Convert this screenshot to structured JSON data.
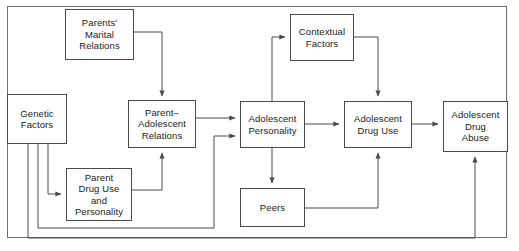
{
  "diagram": {
    "type": "flowchart",
    "stroke_color": "#4a4a4a",
    "text_color": "#1a1a1a",
    "background_color": "#ffffff",
    "frame": {
      "present": true,
      "x": 7,
      "y": 6,
      "width": 500,
      "height": 232
    },
    "nodes": [
      {
        "id": "parents-marital-relations",
        "label": "Parents'\nMarital\nRelations",
        "x": 65,
        "y": 9,
        "width": 69,
        "height": 51
      },
      {
        "id": "contextual-factors",
        "label": "Contextual\nFactors",
        "x": 290,
        "y": 14,
        "width": 64,
        "height": 47
      },
      {
        "id": "genetic-factors",
        "label": "Genetic\nFactors",
        "x": 7,
        "y": 94,
        "width": 60,
        "height": 50
      },
      {
        "id": "parent-adolescent-relations",
        "label": "Parent–\nAdolescent\nRelations",
        "x": 128,
        "y": 100,
        "width": 68,
        "height": 48
      },
      {
        "id": "adolescent-personality",
        "label": "Adolescent\nPersonality",
        "x": 240,
        "y": 101,
        "width": 65,
        "height": 47
      },
      {
        "id": "adolescent-drug-use",
        "label": "Adolescent\nDrug Use",
        "x": 344,
        "y": 101,
        "width": 68,
        "height": 47
      },
      {
        "id": "adolescent-drug-abuse",
        "label": "Adolescent\nDrug\nAbuse",
        "x": 443,
        "y": 101,
        "width": 65,
        "height": 51
      },
      {
        "id": "parent-drug-use-and-personality",
        "label": "Parent\nDrug Use\nand\nPersonality",
        "x": 66,
        "y": 168,
        "width": 66,
        "height": 53
      },
      {
        "id": "peers",
        "label": "Peers",
        "x": 240,
        "y": 188,
        "width": 65,
        "height": 39
      }
    ],
    "edges": [
      {
        "id": "marital-to-parent-adolescent",
        "from": "parents-marital-relations",
        "to": "parent-adolescent-relations",
        "arrow": true
      },
      {
        "id": "genetic-to-parent-drug-use",
        "from": "genetic-factors",
        "to": "parent-drug-use-and-personality",
        "arrow": true
      },
      {
        "id": "genetic-to-adolescent-personality",
        "from": "genetic-factors",
        "to": "adolescent-personality",
        "arrow": true
      },
      {
        "id": "genetic-to-adolescent-drug-abuse",
        "from": "genetic-factors",
        "to": "adolescent-drug-abuse",
        "arrow": true
      },
      {
        "id": "parent-drug-use-to-parent-adolescent",
        "from": "parent-drug-use-and-personality",
        "to": "parent-adolescent-relations",
        "arrow": true
      },
      {
        "id": "parent-adolescent-to-personality",
        "from": "parent-adolescent-relations",
        "to": "adolescent-personality",
        "arrow": true
      },
      {
        "id": "personality-to-contextual",
        "from": "adolescent-personality",
        "to": "contextual-factors",
        "arrow": true
      },
      {
        "id": "contextual-to-drug-use",
        "from": "contextual-factors",
        "to": "adolescent-drug-use",
        "arrow": true
      },
      {
        "id": "personality-to-drug-use",
        "from": "adolescent-personality",
        "to": "adolescent-drug-use",
        "arrow": true
      },
      {
        "id": "personality-to-peers",
        "from": "adolescent-personality",
        "to": "peers",
        "arrow": true
      },
      {
        "id": "peers-to-drug-use",
        "from": "peers",
        "to": "adolescent-drug-use",
        "arrow": true
      },
      {
        "id": "drug-use-to-drug-abuse",
        "from": "adolescent-drug-use",
        "to": "adolescent-drug-abuse",
        "arrow": true
      }
    ]
  }
}
